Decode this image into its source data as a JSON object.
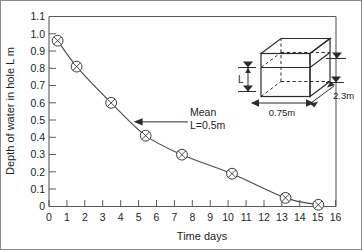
{
  "chart_data": {
    "type": "line",
    "title": "",
    "xlabel": "Time days",
    "ylabel": "Depth of water in hole L m",
    "xlim": [
      0,
      16.6
    ],
    "ylim": [
      0,
      1.1
    ],
    "grid": false,
    "legend": "none",
    "x": [
      0.5,
      1.6,
      3.6,
      5.6,
      7.7,
      10.6,
      13.7,
      15.6
    ],
    "values": [
      0.96,
      0.81,
      0.6,
      0.41,
      0.3,
      0.19,
      0.05,
      0.01
    ],
    "series": [
      {
        "name": "Depth of water in hole",
        "x": [
          0.5,
          1.6,
          3.6,
          5.6,
          7.7,
          10.6,
          13.7,
          15.6
        ],
        "values": [
          0.96,
          0.81,
          0.6,
          0.41,
          0.3,
          0.19,
          0.05,
          0.01
        ]
      }
    ],
    "marker": "circle-with-x",
    "xticks": [
      0,
      1,
      2,
      3,
      4,
      5,
      6,
      7,
      8,
      9,
      10,
      11,
      12,
      13,
      14,
      15,
      16
    ],
    "xticklabels": [
      "0",
      "1",
      "2",
      "3",
      "4",
      "5",
      "6",
      "7",
      "8",
      "9",
      "10",
      "11",
      "12",
      "13",
      "14",
      "15",
      "16"
    ],
    "yticks": [
      0,
      0.1,
      0.2,
      0.3,
      0.4,
      0.5,
      0.6,
      0.7,
      0.8,
      0.9,
      1.0,
      1.1
    ],
    "yticklabels": [
      "0",
      "0.1",
      "0.2",
      "0.3",
      "0.4",
      "0.5",
      "0.6",
      "0.7",
      "0.8",
      "0.9",
      "1.0",
      "1.1"
    ],
    "annotations": [
      {
        "name": "mean-annotation",
        "line1": "Mean",
        "line2": "L=0.5m",
        "points_to_x": 4.9,
        "points_to_y": 0.49
      }
    ]
  },
  "inset": {
    "name": "trench-box-diagram",
    "labels": {
      "height": "L",
      "width": "0.75m",
      "depth": "2.3m"
    }
  }
}
